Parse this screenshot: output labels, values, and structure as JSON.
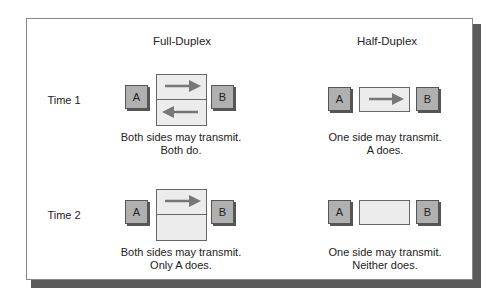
{
  "columns": {
    "full_duplex": {
      "title": "Full-Duplex"
    },
    "half_duplex": {
      "title": "Half-Duplex"
    }
  },
  "rows": [
    {
      "label": "Time 1"
    },
    {
      "label": "Time 2"
    }
  ],
  "nodes": {
    "a": "A",
    "b": "B"
  },
  "captions": {
    "fd_t1": [
      "Both sides may transmit.",
      "Both do."
    ],
    "hd_t1": [
      "One side may transmit.",
      "A does."
    ],
    "fd_t2": [
      "Both sides may transmit.",
      "Only A does."
    ],
    "hd_t2": [
      "One side may transmit.",
      "Neither does."
    ]
  },
  "colors": {
    "node_fill": "#b0b0b0",
    "channel_fill": "#ececec",
    "arrow": "#777777",
    "shadow": "#5a5a5a"
  }
}
